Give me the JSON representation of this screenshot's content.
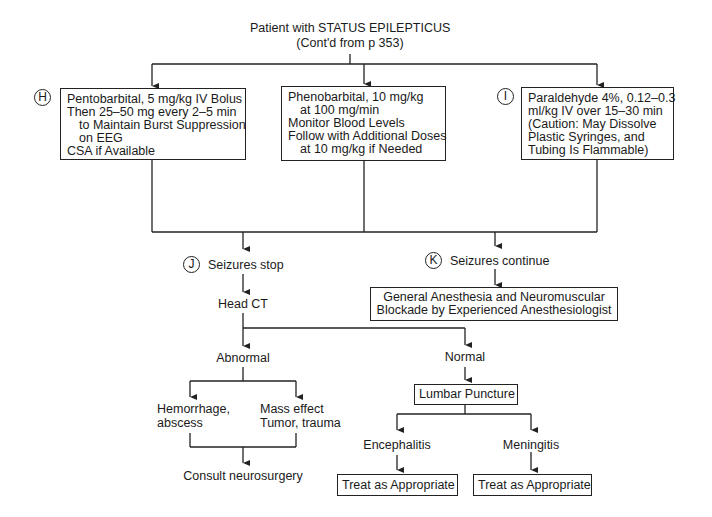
{
  "title": {
    "line1": "Patient with STATUS EPILEPTICUS",
    "line2": "(Cont'd from p 353)"
  },
  "branches": {
    "H": {
      "marker": "H",
      "lines": [
        "Pentobarbital, 5 mg/kg IV Bolus",
        "Then 25–50 mg every 2–5 min",
        "to Maintain Burst Suppression",
        "on EEG",
        "CSA if Available"
      ]
    },
    "pheno": {
      "lines": [
        "Phenobarbital, 10 mg/kg",
        "at 100 mg/min",
        "Monitor Blood Levels",
        "Follow with Additional Doses",
        "at 10 mg/kg if Needed"
      ]
    },
    "I": {
      "marker": "I",
      "lines": [
        "Paraldehyde 4%, 0.12–0.3",
        "ml/kg IV over 15–30 min",
        "(Caution: May Dissolve",
        "Plastic Syringes, and",
        "Tubing Is Flammable)"
      ]
    }
  },
  "outcomes": {
    "J": {
      "marker": "J",
      "label": "Seizures stop"
    },
    "K": {
      "marker": "K",
      "label": "Seizures continue"
    }
  },
  "anesthesia_box": {
    "line1": "General Anesthesia and Neuromuscular",
    "line2": "Blockade by Experienced Anesthesiologist"
  },
  "head_ct": "Head CT",
  "abnormal": {
    "label": "Abnormal",
    "left": {
      "line1": "Hemorrhage,",
      "line2": "abscess"
    },
    "right": {
      "line1": "Mass effect",
      "line2": "Tumor, trauma"
    },
    "result": "Consult neurosurgery"
  },
  "normal": {
    "label": "Normal",
    "lumbar": "Lumbar Puncture",
    "left": {
      "label": "Encephalitis",
      "treat": "Treat as Appropriate"
    },
    "right": {
      "label": "Meningitis",
      "treat": "Treat as Appropriate"
    }
  }
}
